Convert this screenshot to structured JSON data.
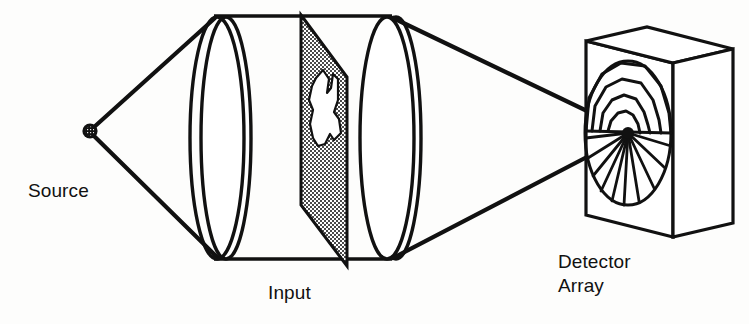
{
  "figure": {
    "background_color": "#fdfdfc",
    "ink_color": "#111111",
    "mask_fill_color": "#7d7d7d"
  },
  "labels": {
    "source": "Source",
    "input": "Input",
    "detector_line1": "Detector",
    "detector_line2": "Array"
  },
  "components": {
    "source": {
      "name": "point-source",
      "shape": "filled-circle-with-hatch",
      "cx": 90,
      "cy": 131,
      "r": 7
    },
    "lens_left": {
      "name": "collimating-lens",
      "cx": 218,
      "cy": 138,
      "rx": 27,
      "ry": 122,
      "offset": 10
    },
    "lens_right": {
      "name": "transform-lens",
      "cx": 388,
      "cy": 138,
      "rx": 27,
      "ry": 122,
      "offset": 10
    },
    "input_mask": {
      "name": "input-transparency",
      "description": "shaded parallelogram plane with irregular clear aperture"
    },
    "detector": {
      "name": "wedge-ring-detector-array",
      "ring_count": 4,
      "wedge_count": 10,
      "cx": 630,
      "cy": 132,
      "rx": 42,
      "ry": 72
    }
  },
  "rays": {
    "diverging_count": 2,
    "converging_count": 2
  }
}
